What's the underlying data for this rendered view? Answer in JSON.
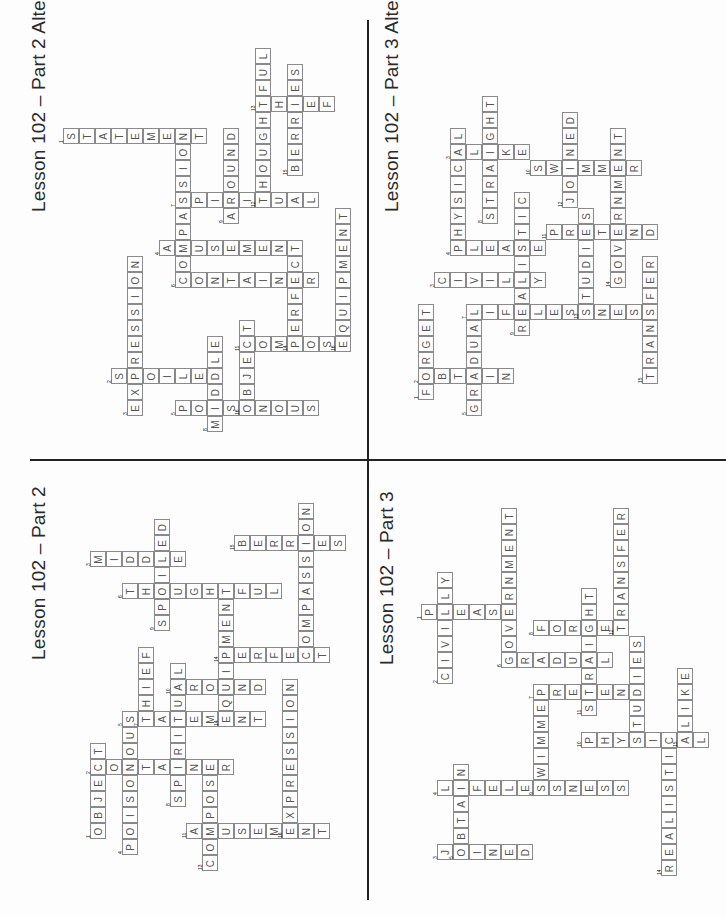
{
  "page": {
    "layout": "four crossword answer grids in quadrants, rotated 90 degrees",
    "quadrants": [
      {
        "id": "tl",
        "title": "Lesson 102 – Part 2 Alternate",
        "title_pos": [
          28,
          212
        ],
        "origin": [
          15,
          0
        ],
        "words": [
          {
            "n": "1",
            "word": "STATEMENT",
            "c": 3,
            "r": 8,
            "dir": "right"
          },
          {
            "n": "2",
            "word": "SPOILED",
            "c": 6,
            "r": 23,
            "dir": "right"
          },
          {
            "n": "3",
            "word": "EXPRESSION",
            "c": 7,
            "r": 25,
            "dir": "up"
          },
          {
            "n": "4",
            "word": "AMUSEMENT",
            "c": 9,
            "r": 15,
            "dir": "right"
          },
          {
            "n": "5",
            "word": "POISONOUS",
            "c": 10,
            "r": 25,
            "dir": "right"
          },
          {
            "n": "6",
            "word": "COMPASSION",
            "c": 10,
            "r": 17,
            "dir": "up"
          },
          {
            "n": "7",
            "word": "SPIRITUAL",
            "c": 10,
            "r": 12,
            "dir": "right"
          },
          {
            "n": "8",
            "word": "MIDDLE",
            "c": 12,
            "r": 26,
            "dir": "up"
          },
          {
            "n": "9",
            "word": "AROUND",
            "c": 13,
            "r": 13,
            "dir": "up"
          },
          {
            "n": "10",
            "word": "CONTAINER",
            "c": 10,
            "r": 17,
            "dir": "right"
          },
          {
            "n": "11",
            "word": "COMPOSE",
            "c": 14,
            "r": 21,
            "dir": "right"
          },
          {
            "n": "12",
            "word": "THOUGHTFUL",
            "c": 15,
            "r": 12,
            "dir": "up"
          },
          {
            "n": "13",
            "word": "THIEF",
            "c": 15,
            "r": 6,
            "dir": "right"
          },
          {
            "n": "14",
            "word": "PERFECT",
            "c": 17,
            "r": 21,
            "dir": "up"
          },
          {
            "n": "15",
            "word": "BERRIES",
            "c": 17,
            "r": 10,
            "dir": "up"
          },
          {
            "n": "16",
            "word": "OBJECT",
            "c": 14,
            "r": 25,
            "dir": "up"
          },
          {
            "n": "16",
            "word": "EQUIPMENT",
            "c": 20,
            "r": 21,
            "dir": "up"
          }
        ]
      },
      {
        "id": "tr",
        "title": "Lesson 102 – Part 3 Alternate",
        "title_pos": [
          381,
          212
        ],
        "origin": [
          418,
          0
        ],
        "words": [
          {
            "n": "1",
            "word": "FORGET",
            "c": 0,
            "r": 24,
            "dir": "up"
          },
          {
            "n": "2",
            "word": "OBTAIN",
            "c": 0,
            "r": 23,
            "dir": "right"
          },
          {
            "n": "3",
            "word": "CIVILLY",
            "c": 1,
            "r": 17,
            "dir": "right"
          },
          {
            "n": "4",
            "word": "PHYSICAL",
            "c": 2,
            "r": 15,
            "dir": "up"
          },
          {
            "n": "3",
            "word": "ALIKE",
            "c": 2,
            "r": 9,
            "dir": "right"
          },
          {
            "n": "5",
            "word": "GRADUAL",
            "c": 3,
            "r": 25,
            "dir": "up"
          },
          {
            "n": "6",
            "word": "PLEASE",
            "c": 2,
            "r": 15,
            "dir": "right"
          },
          {
            "n": "7",
            "word": "LIFELESSNESS",
            "c": 3,
            "r": 19,
            "dir": "right"
          },
          {
            "n": "8",
            "word": "STRAIGHT",
            "c": 4,
            "r": 13,
            "dir": "up"
          },
          {
            "n": "9",
            "word": "REALISTIC",
            "c": 6,
            "r": 20,
            "dir": "up"
          },
          {
            "n": "10",
            "word": "SWIMMER",
            "c": 7,
            "r": 10,
            "dir": "right"
          },
          {
            "n": "11",
            "word": "PRETEND",
            "c": 8,
            "r": 14,
            "dir": "right"
          },
          {
            "n": "12",
            "word": "JOINED",
            "c": 9,
            "r": 12,
            "dir": "up"
          },
          {
            "n": "13",
            "word": "STUDIES",
            "c": 10,
            "r": 19,
            "dir": "up"
          },
          {
            "n": "14",
            "word": "GOVERNMENT",
            "c": 12,
            "r": 17,
            "dir": "up"
          },
          {
            "n": "15",
            "word": "TRANSFER",
            "c": 14,
            "r": 23,
            "dir": "up"
          }
        ]
      },
      {
        "id": "bl",
        "title": "Lesson 102 – Part 2",
        "title_pos": [
          28,
          660
        ],
        "origin": [
          10,
          455
        ],
        "words": [
          {
            "n": "1",
            "word": "OBJECT",
            "c": 5,
            "r": 23,
            "dir": "up"
          },
          {
            "n": "2",
            "word": "CONTAINER",
            "c": 5,
            "r": 19,
            "dir": "right"
          },
          {
            "n": "3",
            "word": "MIDDLE",
            "c": 5,
            "r": 6,
            "dir": "right"
          },
          {
            "n": "4",
            "word": "POISONOUS",
            "c": 7,
            "r": 24,
            "dir": "up"
          },
          {
            "n": "5",
            "word": "STATEMENT",
            "c": 7,
            "r": 16,
            "dir": "right"
          },
          {
            "n": "6",
            "word": "THOUGHTFUL",
            "c": 7,
            "r": 8,
            "dir": "right"
          },
          {
            "n": "7",
            "word": "THIEF",
            "c": 8,
            "r": 16,
            "dir": "up"
          },
          {
            "n": "8",
            "word": "SPIRITUAL",
            "c": 10,
            "r": 21,
            "dir": "up"
          },
          {
            "n": "9",
            "word": "SPOILED",
            "c": 9,
            "r": 10,
            "dir": "up"
          },
          {
            "n": "10",
            "word": "AROUND",
            "c": 10,
            "r": 14,
            "dir": "right"
          },
          {
            "n": "11",
            "word": "AMUSEMENT",
            "c": 11,
            "r": 23,
            "dir": "right"
          },
          {
            "n": "12",
            "word": "COMPASSION",
            "c": 18,
            "r": 12,
            "dir": "up"
          },
          {
            "n": "13",
            "word": "COMPOSE",
            "c": 12,
            "r": 25,
            "dir": "up"
          },
          {
            "n": "14",
            "word": "PERFECT",
            "c": 13,
            "r": 12,
            "dir": "right"
          },
          {
            "n": "14",
            "word": "EQUIPMENT",
            "c": 13,
            "r": 16,
            "dir": "up"
          },
          {
            "n": "15",
            "word": "BERRIES",
            "c": 14,
            "r": 5,
            "dir": "right"
          },
          {
            "n": "16",
            "word": "EXPRESSION",
            "c": 17,
            "r": 23,
            "dir": "up"
          }
        ]
      },
      {
        "id": "br",
        "title": "Lesson 102 – Part 3",
        "title_pos": [
          376,
          665
        ],
        "origin": [
          373,
          460
        ],
        "words": [
          {
            "n": "1",
            "word": "PLEASE",
            "c": 3,
            "r": 9,
            "dir": "right"
          },
          {
            "n": "2",
            "word": "CIVILLY",
            "c": 4,
            "r": 13,
            "dir": "up"
          },
          {
            "n": "3",
            "word": "JOINED",
            "c": 4,
            "r": 24,
            "dir": "right"
          },
          {
            "n": "4",
            "word": "LIFELESSNESS",
            "c": 4,
            "r": 20,
            "dir": "right"
          },
          {
            "n": "5",
            "word": "OBTAIN",
            "c": 5,
            "r": 24,
            "dir": "up"
          },
          {
            "n": "6",
            "word": "GOVERNMENT",
            "c": 8,
            "r": 12,
            "dir": "up"
          },
          {
            "n": "6",
            "word": "GRADUAL",
            "c": 8,
            "r": 12,
            "dir": "right"
          },
          {
            "n": "7",
            "word": "PRETEND",
            "c": 10,
            "r": 14,
            "dir": "right"
          },
          {
            "n": "8",
            "word": "FORGET",
            "c": 10,
            "r": 10,
            "dir": "right"
          },
          {
            "n": "9",
            "word": "SWIMMER",
            "c": 10,
            "r": 20,
            "dir": "up"
          },
          {
            "n": "11",
            "word": "STRAIGHT",
            "c": 13,
            "r": 15,
            "dir": "up"
          },
          {
            "n": "12",
            "word": "TRANSFER",
            "c": 15,
            "r": 10,
            "dir": "up"
          },
          {
            "n": "13",
            "word": "STUDIES",
            "c": 16,
            "r": 17,
            "dir": "up"
          },
          {
            "n": "14",
            "word": "REALISTIC",
            "c": 18,
            "r": 25,
            "dir": "up"
          },
          {
            "n": "15",
            "word": "ALIKE",
            "c": 19,
            "r": 17,
            "dir": "up"
          },
          {
            "n": "10",
            "word": "PHYSICAL",
            "c": 13,
            "r": 17,
            "dir": "right"
          }
        ]
      }
    ]
  },
  "titles": {
    "tl": "Lesson 102 – Part 2 Alternate",
    "tr": "Lesson 102 – Part 3 Alternate",
    "bl": "Lesson 102 – Part 2",
    "br": "Lesson 102 – Part 3"
  },
  "colors": {
    "line": "#222222",
    "cell_border": "#8a8a8a",
    "letter": "#555555"
  }
}
